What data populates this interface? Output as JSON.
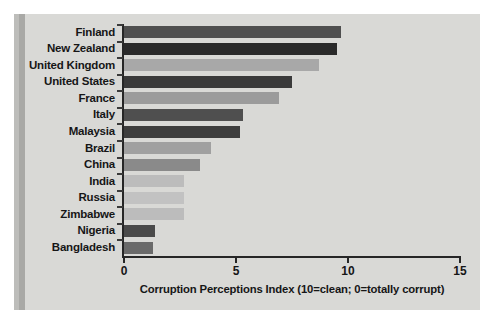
{
  "chart_data": {
    "type": "bar",
    "orientation": "horizontal",
    "title": "",
    "xlabel": "Corruption Perceptions Index (10=clean; 0=totally corrupt)",
    "ylabel": "",
    "xlim": [
      0,
      15
    ],
    "xticks": [
      "0",
      "5",
      "10",
      "15"
    ],
    "xtick_values": [
      0,
      5,
      10,
      15
    ],
    "grid": false,
    "legend": false,
    "categories": [
      "Finland",
      "New Zealand",
      "United Kingdom",
      "United States",
      "France",
      "Italy",
      "Malaysia",
      "Brazil",
      "China",
      "India",
      "Russia",
      "Zimbabwe",
      "Nigeria",
      "Bangladesh"
    ],
    "values": [
      9.7,
      9.5,
      8.7,
      7.5,
      6.9,
      5.3,
      5.2,
      3.9,
      3.4,
      2.7,
      2.7,
      2.7,
      1.4,
      1.3
    ],
    "bar_colors": [
      "#4f4f4f",
      "#2a2a2a",
      "#a8a8a8",
      "#3a3a3a",
      "#9b9b9b",
      "#4f4f4f",
      "#3d3d3d",
      "#a0a0a0",
      "#8a8a8a",
      "#bcbcbc",
      "#c2c2c2",
      "#bcbcbc",
      "#4a4a4a",
      "#6a6a6a"
    ]
  },
  "colors": {
    "plot_background": "#d9d9d6",
    "page_background": "#ffffff",
    "axis": "#262626",
    "text": "#161616",
    "left_band": "#a9a9a6"
  }
}
